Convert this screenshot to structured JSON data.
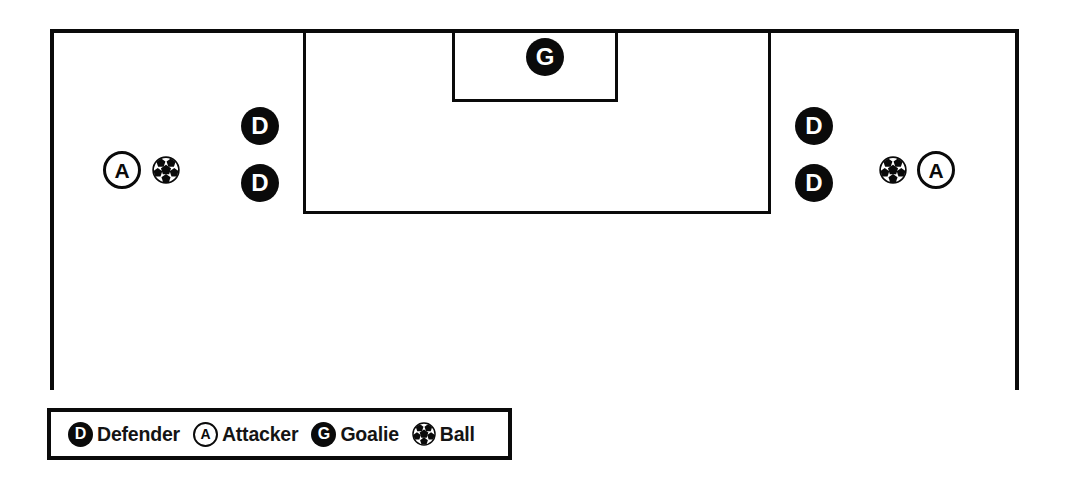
{
  "diagram": {
    "sport": "soccer",
    "colors": {
      "line": "#0a0a0a",
      "marker_fill": "#0a0a0a",
      "marker_text": "#ffffff",
      "background": "#ffffff"
    },
    "field": {
      "name": "half-field-attacking-third",
      "markings": [
        {
          "name": "goal-line",
          "type": "line"
        },
        {
          "name": "touchline-left",
          "type": "line"
        },
        {
          "name": "touchline-right",
          "type": "line"
        },
        {
          "name": "penalty-area",
          "type": "rectangle"
        },
        {
          "name": "goal-area",
          "type": "rectangle"
        }
      ]
    },
    "markers": [
      {
        "id": "goalie-center",
        "role": "G",
        "label": "G",
        "style": "filled",
        "zone": "goal-area",
        "x": 545,
        "y": 57
      },
      {
        "id": "defender-left-top",
        "role": "D",
        "label": "D",
        "style": "filled",
        "zone": "left-flank",
        "x": 260,
        "y": 126
      },
      {
        "id": "defender-left-bottom",
        "role": "D",
        "label": "D",
        "style": "filled",
        "zone": "left-flank",
        "x": 260,
        "y": 183
      },
      {
        "id": "attacker-left",
        "role": "A",
        "label": "A",
        "style": "ringed",
        "zone": "left-wing",
        "x": 122,
        "y": 170
      },
      {
        "id": "defender-right-top",
        "role": "D",
        "label": "D",
        "style": "filled",
        "zone": "right-flank",
        "x": 814,
        "y": 126
      },
      {
        "id": "defender-right-bottom",
        "role": "D",
        "label": "D",
        "style": "filled",
        "zone": "right-flank",
        "x": 814,
        "y": 183
      },
      {
        "id": "attacker-right",
        "role": "A",
        "label": "A",
        "style": "ringed",
        "zone": "right-wing",
        "x": 936,
        "y": 170
      }
    ],
    "balls": [
      {
        "id": "ball-left",
        "icon": "soccer-ball-icon",
        "x": 166,
        "y": 170
      },
      {
        "id": "ball-right",
        "icon": "soccer-ball-icon",
        "x": 893,
        "y": 170
      }
    ]
  },
  "legend": {
    "entries": [
      {
        "key": "defender",
        "symbol": "D",
        "style": "filled",
        "label": "Defender"
      },
      {
        "key": "attacker",
        "symbol": "A",
        "style": "ringed",
        "label": "Attacker"
      },
      {
        "key": "goalie",
        "symbol": "G",
        "style": "filled",
        "label": "Goalie"
      },
      {
        "key": "ball",
        "symbol": "soccer-ball-icon",
        "style": "ball",
        "label": "Ball"
      }
    ]
  }
}
